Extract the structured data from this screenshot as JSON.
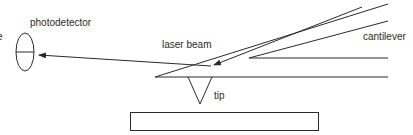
{
  "diagram": {
    "labels": {
      "cut_left": "e",
      "photodetector": "photodetector",
      "laser_beam": "laser beam",
      "cantilever": "cantilever",
      "tip": "tip"
    },
    "colors": {
      "stroke": "#2a2a2a",
      "background": "#ffffff"
    }
  }
}
